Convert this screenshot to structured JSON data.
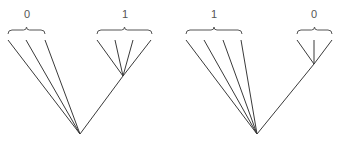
{
  "diagram": {
    "type": "phylogenetic-tree-pair",
    "line_color": "#3a3a3a",
    "trees": [
      {
        "name": "left-tree",
        "root": [
          80,
          134
        ],
        "groups": [
          {
            "label": "0",
            "label_pos": [
              27,
              18
            ],
            "brace": {
              "x1": 8,
              "x2": 45,
              "y": 30
            },
            "internal_node": null,
            "leaves": [
              [
                8,
                40
              ],
              [
                26,
                40
              ],
              [
                45,
                40
              ]
            ]
          },
          {
            "label": "1",
            "label_pos": [
              125,
              18
            ],
            "brace": {
              "x1": 97,
              "x2": 152,
              "y": 30
            },
            "internal_node": [
              123,
              76
            ],
            "leaves": [
              [
                97,
                40
              ],
              [
                115,
                40
              ],
              [
                133,
                40
              ],
              [
                151,
                40
              ]
            ]
          }
        ]
      },
      {
        "name": "right-tree",
        "root": [
          257,
          134
        ],
        "groups": [
          {
            "label": "1",
            "label_pos": [
              214,
              18
            ],
            "brace": {
              "x1": 186,
              "x2": 242,
              "y": 30
            },
            "internal_node": null,
            "leaves": [
              [
                186,
                40
              ],
              [
                204,
                40
              ],
              [
                223,
                40
              ],
              [
                241,
                40
              ]
            ]
          },
          {
            "label": "0",
            "label_pos": [
              314,
              18
            ],
            "brace": {
              "x1": 297,
              "x2": 332,
              "y": 30
            },
            "internal_node": [
              314,
              64
            ],
            "leaves": [
              [
                297,
                40
              ],
              [
                314,
                40
              ],
              [
                332,
                40
              ]
            ]
          }
        ]
      }
    ]
  }
}
